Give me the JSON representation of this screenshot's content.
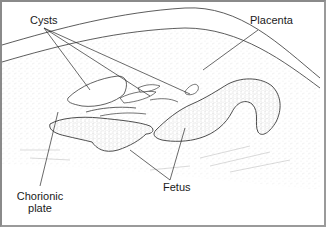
{
  "figure": {
    "type": "anatomical line illustration",
    "labels": {
      "cysts": "Cysts",
      "placenta": "Placenta",
      "chorionic_line1": "Chorionic",
      "chorionic_line2": "plate",
      "fetus": "Fetus"
    },
    "colors": {
      "ink": "#1a1a1a",
      "outline": "#555555",
      "stipple": "#9a9a9a",
      "background": "#ffffff"
    }
  }
}
